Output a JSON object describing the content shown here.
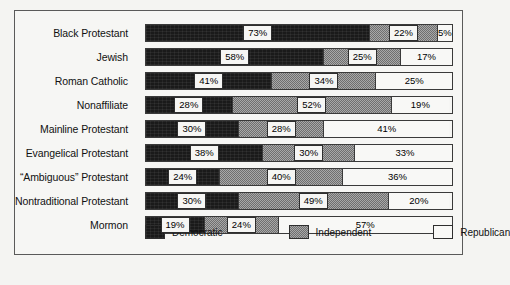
{
  "chart_data": {
    "type": "bar",
    "subtype": "stacked-horizontal-100pct",
    "title": "",
    "xlabel": "",
    "ylabel": "",
    "xlim": [
      0,
      100
    ],
    "grid": false,
    "legend_position": "bottom",
    "unit": "%",
    "categories": [
      "Black Protestant",
      "Jewish",
      "Roman Catholic",
      "Nonaffiliate",
      "Mainline Protestant",
      "Evangelical Protestant",
      "“Ambiguous” Protestant",
      "Nontraditional Protestant",
      "Mormon"
    ],
    "series": [
      {
        "name": "Democratic",
        "color": "#1a1a1a",
        "values": [
          73,
          58,
          41,
          28,
          30,
          38,
          24,
          30,
          19
        ]
      },
      {
        "name": "Independent",
        "color": "#8b8b8b",
        "values": [
          22,
          25,
          34,
          52,
          28,
          30,
          40,
          49,
          24
        ]
      },
      {
        "name": "Republican",
        "color": "#f8f8f6",
        "values": [
          5,
          17,
          25,
          19,
          41,
          33,
          36,
          20,
          57
        ]
      }
    ],
    "value_labels": [
      [
        "73%",
        "22%",
        "5%"
      ],
      [
        "58%",
        "25%",
        "17%"
      ],
      [
        "41%",
        "34%",
        "25%"
      ],
      [
        "28%",
        "52%",
        "19%"
      ],
      [
        "30%",
        "28%",
        "41%"
      ],
      [
        "38%",
        "30%",
        "33%"
      ],
      [
        "24%",
        "40%",
        "36%"
      ],
      [
        "30%",
        "49%",
        "20%"
      ],
      [
        "19%",
        "24%",
        "57%"
      ]
    ]
  },
  "legend": {
    "items": [
      {
        "label": "Democratic",
        "swatch": "solid-black"
      },
      {
        "label": "Independent",
        "swatch": "dithered-gray"
      },
      {
        "label": "Republican",
        "swatch": "white"
      }
    ]
  }
}
